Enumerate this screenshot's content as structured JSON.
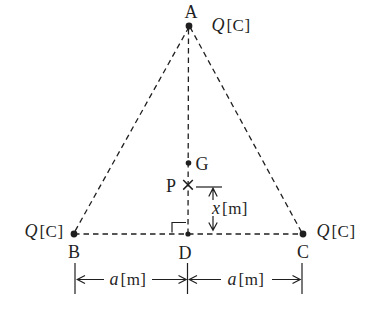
{
  "figure": {
    "background": "#ffffff",
    "ink_color": "#1f1f1f",
    "kind": "charged-triangle-diagram"
  },
  "points": {
    "a": "A",
    "b": "B",
    "c": "C",
    "d": "D",
    "g": "G",
    "p": "P"
  },
  "charges": {
    "top": {
      "symbol": "Q",
      "unit": "[C]"
    },
    "bottom_left": {
      "symbol": "Q",
      "unit": "[C]"
    },
    "bottom_right": {
      "symbol": "Q",
      "unit": "[C]"
    }
  },
  "dimensions": {
    "pd_height": {
      "symbol": "x",
      "unit": "[m]"
    },
    "base_left": {
      "symbol": "a",
      "unit": "[m]"
    },
    "base_right": {
      "symbol": "a",
      "unit": "[m]"
    }
  },
  "markers": {
    "charge_dot": "●",
    "point_p_cross": "×",
    "right_angle": "∟"
  }
}
